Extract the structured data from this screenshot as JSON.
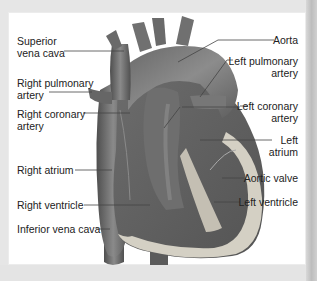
{
  "diagram": {
    "labels_left": [
      {
        "id": "superior-vena-cava",
        "lines": [
          "Superior",
          "vena cava"
        ]
      },
      {
        "id": "right-pulmonary-artery",
        "lines": [
          "Right pulmonary",
          "artery"
        ]
      },
      {
        "id": "right-coronary-artery",
        "lines": [
          "Right coronary",
          "artery"
        ]
      },
      {
        "id": "right-atrium",
        "lines": [
          "Right atrium"
        ]
      },
      {
        "id": "right-ventricle",
        "lines": [
          "Right ventricle"
        ]
      },
      {
        "id": "inferior-vena-cava",
        "lines": [
          "Inferior vena cava"
        ]
      }
    ],
    "labels_right": [
      {
        "id": "aorta",
        "lines": [
          "Aorta"
        ]
      },
      {
        "id": "left-pulmonary-artery",
        "lines": [
          "Left pulmonary",
          "artery"
        ]
      },
      {
        "id": "left-coronary-artery",
        "lines": [
          "Left coronary",
          "artery"
        ]
      },
      {
        "id": "left-atrium",
        "lines": [
          "Left",
          "atrium"
        ]
      },
      {
        "id": "aortic-valve",
        "lines": [
          "Aortic valve"
        ]
      },
      {
        "id": "left-ventricle",
        "lines": [
          "Left ventricle"
        ]
      }
    ],
    "colors": {
      "tissue_dark": "#5a5a5a",
      "tissue_mid": "#7a7a7a",
      "tissue_light": "#9a9a9a",
      "myocardium_wall": "#d4d0c4",
      "leader_line": "#444444",
      "background": "#ffffff"
    }
  }
}
